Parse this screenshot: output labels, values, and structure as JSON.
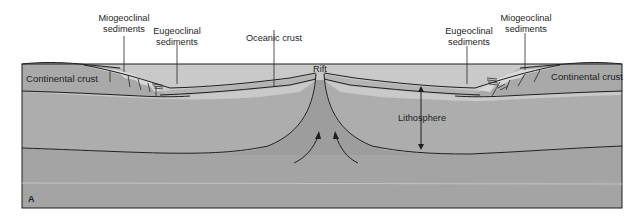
{
  "figure": {
    "panel_label": "A",
    "colors": {
      "background": "#ffffff",
      "ocean": "#c9c9c9",
      "crust": "#a9a9a9",
      "oceanic_crust_layer": "#b4b4b4",
      "lithosphere": "#adadad",
      "asthenosphere": "#a4a4a4",
      "rift_upwelling": "#9c9c9c",
      "sediments": "#d6d6d6",
      "lines": "#1f1f1f"
    }
  },
  "labels": {
    "miogeoclinal_left": [
      "Miogeoclinal",
      "sediments"
    ],
    "eugeoclinal_left": [
      "Eugeoclinal",
      "sediments"
    ],
    "oceanic_crust": "Oceanic crust",
    "eugeoclinal_right": [
      "Eugeoclinal",
      "sediments"
    ],
    "miogeoclinal_right": [
      "Miogeoclinal",
      "sediments"
    ],
    "continental_crust_left": "Continental crust",
    "continental_crust_right": "Continental crust",
    "rift": "Rift",
    "lithosphere": "Lithosphere"
  }
}
